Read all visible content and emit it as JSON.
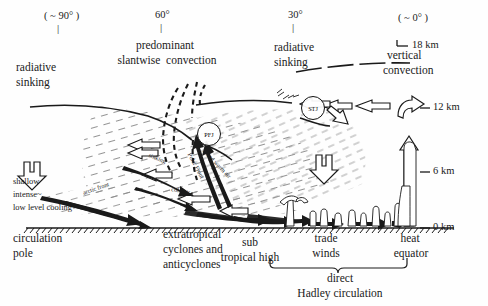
{
  "figure": {
    "type": "schematic-cross-section",
    "title_implicit": "Meridional cross-section of the general circulation of the atmosphere",
    "width": 488,
    "height": 306,
    "background": "#ffffff",
    "ink": "#1a1a1a"
  },
  "latitude_ticks": [
    {
      "label": "( ~ 90° )",
      "x_px": 44,
      "y_px": 16
    },
    {
      "label": "60°",
      "x_px": 158,
      "y_px": 14
    },
    {
      "label": "30°",
      "x_px": 292,
      "y_px": 14
    },
    {
      "label": "( ~ 0° )",
      "x_px": 418,
      "y_px": 18
    }
  ],
  "altitude_axis": {
    "unit": "km",
    "ticks": [
      {
        "label": "18 km",
        "value": 18,
        "y_px": 46
      },
      {
        "label": "12 km",
        "value": 12,
        "y_px": 108
      },
      {
        "label": "6 km",
        "value": 6,
        "y_px": 172
      },
      {
        "label": "0 km",
        "value": 0,
        "y_px": 228
      }
    ]
  },
  "top_annotations": [
    {
      "name": "radiative-sinking-polar",
      "lines": [
        "radiative",
        "sinking"
      ],
      "x_px": 18,
      "y_px": 62
    },
    {
      "name": "predominant-slantwise-convection",
      "lines": [
        "predominant",
        "slantwise  convection"
      ],
      "x_px": 120,
      "y_px": 44
    },
    {
      "name": "radiative-sinking-subtropical",
      "lines": [
        "radiative",
        "sinking"
      ],
      "x_px": 275,
      "y_px": 45
    },
    {
      "name": "vertical-convection",
      "lines": [
        "vertical",
        "convection"
      ],
      "x_px": 388,
      "y_px": 54
    }
  ],
  "jet_streams": [
    {
      "code": "PFJ",
      "full_name": "Polar Front Jet",
      "cx_px": 208,
      "cy_px": 133,
      "r_px": 11
    },
    {
      "code": "STJ",
      "full_name": "Subtropical Jet",
      "cx_px": 312,
      "cy_px": 107,
      "r_px": 11
    }
  ],
  "tropopause_break_marks": {
    "label": "≡≡≡",
    "x_px": 275,
    "y_px": 90
  },
  "interior_labels": [
    {
      "name": "sinking",
      "text": "sinking",
      "x_px": 158,
      "y_px": 158,
      "rotate_deg": 22
    },
    {
      "name": "polar-front",
      "text": "Polar Front",
      "x_px": 191,
      "y_px": 160,
      "rotate_deg": 62
    },
    {
      "name": "rising-warm-air",
      "text": "rising warm air",
      "x_px": 203,
      "y_px": 150,
      "rotate_deg": 44
    },
    {
      "name": "cold-air",
      "text": "cold air",
      "x_px": 176,
      "y_px": 188,
      "rotate_deg": 12
    },
    {
      "name": "arctic-front",
      "text": "arctic front",
      "x_px": 86,
      "y_px": 184,
      "rotate_deg": -20
    }
  ],
  "left_block": {
    "name": "shallow-intense-low-level-cooling",
    "lines": [
      "shallow",
      "intense~",
      "low level cooling"
    ],
    "x_px": 14,
    "y_px": 179
  },
  "surface_labels": [
    {
      "name": "circulation-pole",
      "lines": [
        "circulation",
        "pole"
      ],
      "x_px": 14,
      "y_px": 233,
      "align": "left"
    },
    {
      "name": "extratropical-cyclones-and-anticyclones",
      "lines": [
        "extratropical",
        "cyclones and",
        "anticyclones"
      ],
      "x_px": 164,
      "y_px": 229,
      "align": "left"
    },
    {
      "name": "sub-tropical-high",
      "lines": [
        "sub",
        "tropical high"
      ],
      "x_px": 250,
      "y_px": 237,
      "align": "center"
    },
    {
      "name": "trade-winds",
      "lines": [
        "trade",
        "winds"
      ],
      "x_px": 325,
      "y_px": 234,
      "align": "center"
    },
    {
      "name": "heat-equator",
      "lines": [
        "heat",
        "equator"
      ],
      "x_px": 410,
      "y_px": 234,
      "align": "center"
    }
  ],
  "hadley_brace": {
    "name": "direct-hadley-circulation",
    "lines": [
      "direct",
      "Hadley circulation"
    ],
    "x_from_px": 270,
    "x_to_px": 408,
    "y_px": 272
  },
  "colors": {
    "ink": "#1a1a1a",
    "hatch": "#8a8a8a",
    "fill_white": "#ffffff",
    "paper": "#ffffff"
  }
}
